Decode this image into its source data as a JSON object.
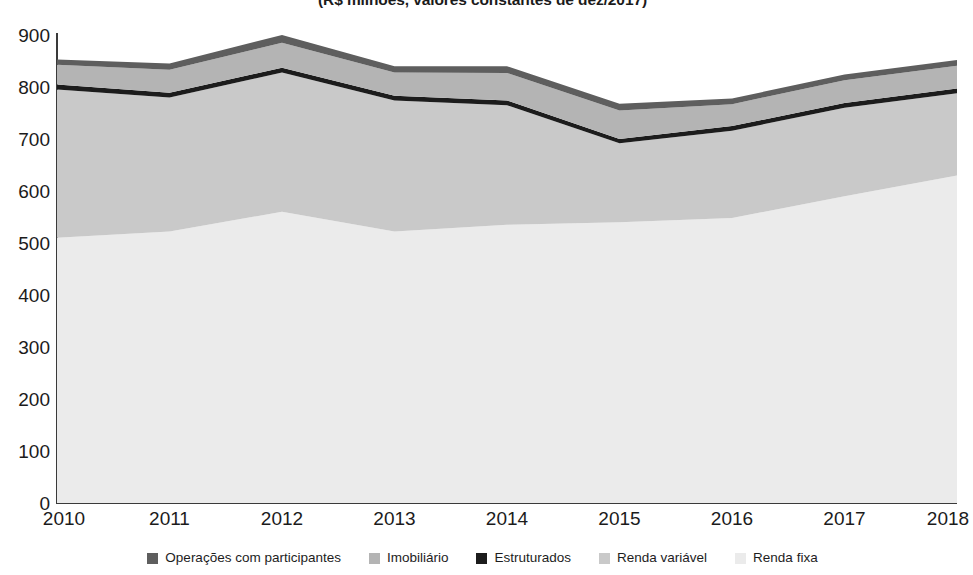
{
  "chart_data": {
    "type": "area",
    "stacked": true,
    "title": "(R$ milhões, valores constantes de dez/2017)",
    "xlabel": "",
    "ylabel": "",
    "categories": [
      "2010",
      "2011",
      "2012",
      "2013",
      "2014",
      "2015",
      "2016",
      "2017",
      "2018"
    ],
    "x": [
      2010,
      2011,
      2012,
      2013,
      2014,
      2015,
      2016,
      2017,
      2018
    ],
    "ylim": [
      0,
      900
    ],
    "yticks": [
      0,
      100,
      200,
      300,
      400,
      500,
      600,
      700,
      800,
      900
    ],
    "ytick_labels": [
      "0",
      "100",
      "200",
      "300",
      "400",
      "500",
      "600",
      "700",
      "800",
      "900"
    ],
    "grid": false,
    "legend_position": "bottom",
    "stack_order_bottom_to_top": [
      "Renda fixa",
      "Renda variável",
      "Estruturados",
      "Imobiliário",
      "Operações com participantes"
    ],
    "series": [
      {
        "name": "Renda fixa",
        "color": "#ebebeb",
        "values": [
          510,
          522,
          560,
          522,
          535,
          540,
          548,
          590,
          630
        ]
      },
      {
        "name": "Renda variável",
        "color": "#c9c9c9",
        "values": [
          285,
          258,
          268,
          252,
          230,
          152,
          168,
          170,
          158
        ]
      },
      {
        "name": "Estruturados",
        "color": "#1c1c1c",
        "values": [
          10,
          9,
          9,
          9,
          9,
          8,
          9,
          9,
          9
        ]
      },
      {
        "name": "Imobiliário",
        "color": "#b4b4b4",
        "values": [
          38,
          44,
          48,
          45,
          53,
          55,
          42,
          44,
          44
        ]
      },
      {
        "name": "Operações com participantes",
        "color": "#5e5e5e",
        "values": [
          10,
          12,
          15,
          12,
          13,
          13,
          11,
          11,
          11
        ]
      }
    ],
    "cumulative_tops": {
      "Renda fixa": [
        510,
        522,
        560,
        522,
        535,
        540,
        548,
        590,
        630
      ],
      "Renda variável": [
        795,
        780,
        828,
        774,
        765,
        692,
        716,
        760,
        788
      ],
      "Estruturados": [
        805,
        789,
        837,
        783,
        774,
        700,
        725,
        769,
        797
      ],
      "Imobiliário": [
        843,
        833,
        885,
        828,
        827,
        755,
        767,
        813,
        841
      ],
      "Operações com participantes": [
        853,
        845,
        900,
        840,
        840,
        768,
        778,
        824,
        852
      ]
    }
  },
  "legend": {
    "items": [
      {
        "label": "Operações com participantes",
        "color": "#5e5e5e"
      },
      {
        "label": "Imobiliário",
        "color": "#b4b4b4"
      },
      {
        "label": "Estruturados",
        "color": "#1c1c1c"
      },
      {
        "label": "Renda variável",
        "color": "#c9c9c9"
      },
      {
        "label": "Renda fixa",
        "color": "#ebebeb"
      }
    ]
  },
  "axes": {
    "y_tick_labels": [
      "900",
      "800",
      "700",
      "600",
      "500",
      "400",
      "300",
      "200",
      "100",
      "0"
    ],
    "x_tick_labels": [
      "2010",
      "2011",
      "2012",
      "2013",
      "2014",
      "2015",
      "2016",
      "2017",
      "2018"
    ],
    "axis_color": "#3a3a3a"
  }
}
